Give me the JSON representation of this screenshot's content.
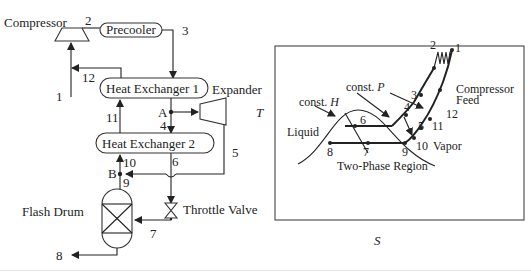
{
  "process_flow": {
    "units": {
      "compressor": "Compressor",
      "precooler": "Precooler",
      "heat_exchanger_1": "Heat Exchanger 1",
      "heat_exchanger_2": "Heat Exchanger 2",
      "expander": "Expander",
      "throttle_valve": "Throttle Valve",
      "flash_drum": "Flash Drum"
    },
    "streams": [
      "1",
      "2",
      "3",
      "4",
      "5",
      "6",
      "7",
      "8",
      "9",
      "10",
      "11",
      "12"
    ],
    "nodes": {
      "a": "A",
      "b": "B"
    }
  },
  "ts_diagram": {
    "y_axis": "T",
    "x_axis": "S",
    "annotations": {
      "const_h": "const.",
      "const_h_var": "H",
      "const_p": "const.",
      "const_p_var": "P",
      "liquid": "Liquid",
      "vapor": "Vapor",
      "two_phase": "Two-Phase Region",
      "compressor_feed_1": "Compressor",
      "compressor_feed_2": "Feed"
    },
    "points": [
      "1",
      "2",
      "3",
      "4",
      "5",
      "6",
      "7",
      "8",
      "9",
      "10",
      "11",
      "12"
    ]
  }
}
